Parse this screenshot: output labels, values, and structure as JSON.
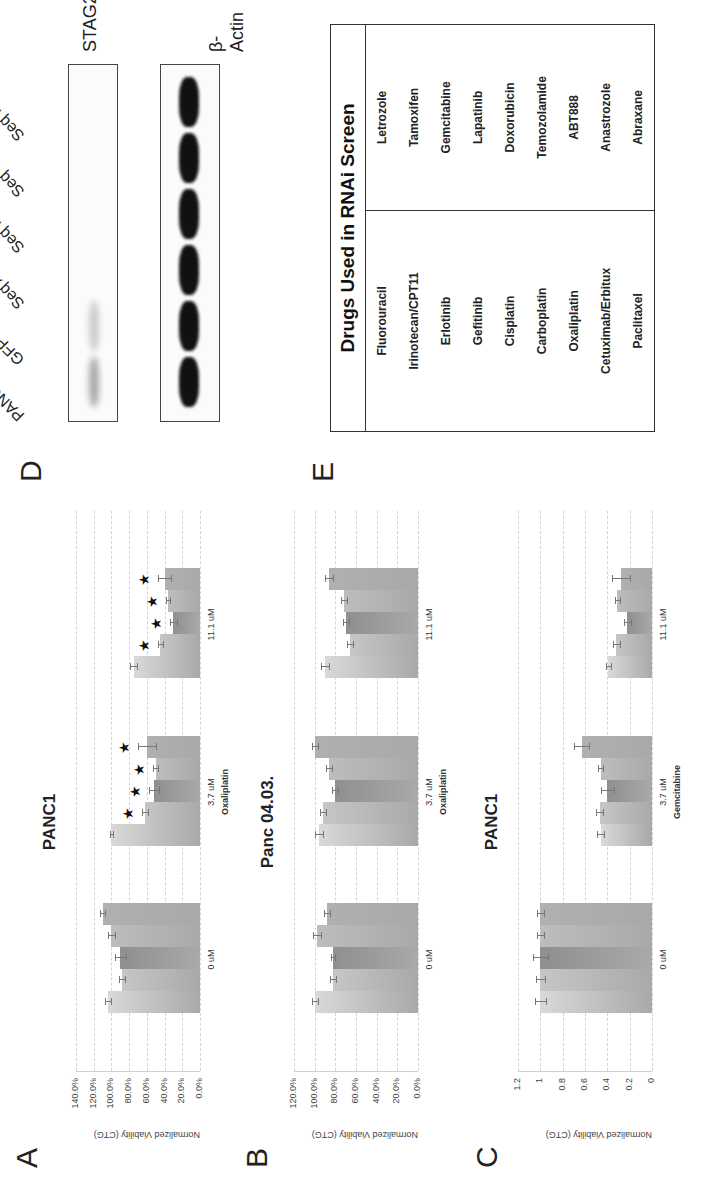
{
  "figure": {
    "panels": {
      "A": {
        "letter": "A"
      },
      "B": {
        "letter": "B"
      },
      "C": {
        "letter": "C"
      },
      "D": {
        "letter": "D"
      },
      "E": {
        "letter": "E"
      }
    }
  },
  "chart_data": [
    {
      "panel": "A",
      "type": "bar",
      "title": "PANC1",
      "xlabel": "Oxaliplatin",
      "ylabel": "Normalized Viability (CTG)",
      "yticks": [
        "0.0%",
        "20.0%",
        "40.0%",
        "60.0%",
        "80.0%",
        "100.0%",
        "120.0%",
        "140.0%"
      ],
      "ylim": [
        0,
        140
      ],
      "grid": true,
      "categories": [
        "0 uM",
        "3.7 uM",
        "11.1 uM"
      ],
      "series": [
        {
          "name": "PANC-1",
          "values": [
            104,
            100,
            75
          ],
          "errors": [
            3,
            2,
            4
          ],
          "significant": [
            false,
            false,
            false
          ]
        },
        {
          "name": "GFP",
          "values": [
            88,
            62,
            45
          ],
          "errors": [
            3,
            3,
            3
          ],
          "significant": [
            false,
            true,
            true
          ]
        },
        {
          "name": "Seq A",
          "values": [
            90,
            52,
            30
          ],
          "errors": [
            6,
            6,
            4
          ],
          "significant": [
            false,
            true,
            true
          ]
        },
        {
          "name": "Seq B",
          "values": [
            100,
            50,
            36
          ],
          "errors": [
            4,
            3,
            2
          ],
          "significant": [
            false,
            true,
            true
          ]
        },
        {
          "name": "Seq C",
          "values": [
            110,
            60,
            40
          ],
          "errors": [
            3,
            10,
            7
          ],
          "significant": [
            false,
            true,
            true
          ]
        }
      ]
    },
    {
      "panel": "B",
      "type": "bar",
      "title": "Panc 04.03.",
      "xlabel": "Oxaliplatin",
      "ylabel": "Normalized Viability (CTG)",
      "yticks": [
        "0.0%",
        "20.0%",
        "40.0%",
        "60.0%",
        "80.0%",
        "100.0%",
        "120.0%"
      ],
      "ylim": [
        0,
        120
      ],
      "grid": true,
      "categories": [
        "0 uM",
        "3.7 uM",
        "11.1 uM"
      ],
      "series": [
        {
          "name": "PANC-1",
          "values": [
            100,
            96,
            90
          ],
          "errors": [
            3,
            4,
            4
          ]
        },
        {
          "name": "GFP",
          "values": [
            82,
            92,
            66
          ],
          "errors": [
            3,
            3,
            3
          ]
        },
        {
          "name": "Seq A",
          "values": [
            82,
            80,
            70
          ],
          "errors": [
            2,
            3,
            3
          ]
        },
        {
          "name": "Seq B",
          "values": [
            98,
            86,
            72
          ],
          "errors": [
            4,
            3,
            3
          ]
        },
        {
          "name": "Seq C",
          "values": [
            88,
            100,
            86
          ],
          "errors": [
            3,
            3,
            4
          ]
        }
      ]
    },
    {
      "panel": "C",
      "type": "bar",
      "title": "PANC1",
      "xlabel": "Gemcitabine",
      "ylabel": "Normalized Viability (CTG)",
      "yticks": [
        "0",
        "0.2",
        "0.4",
        "0.6",
        "0.8",
        "1",
        "1.2"
      ],
      "ylim": [
        0,
        1.2
      ],
      "grid": true,
      "categories": [
        "0 uM",
        "3.7 uM",
        "11.1 uM"
      ],
      "series": [
        {
          "name": "PANC-1",
          "values": [
            1.0,
            0.46,
            0.39
          ],
          "errors": [
            0.05,
            0.03,
            0.02
          ]
        },
        {
          "name": "GFP",
          "values": [
            1.0,
            0.47,
            0.32
          ],
          "errors": [
            0.04,
            0.03,
            0.03
          ]
        },
        {
          "name": "Seq A",
          "values": [
            1.0,
            0.4,
            0.22
          ],
          "errors": [
            0.07,
            0.06,
            0.03
          ]
        },
        {
          "name": "Seq B",
          "values": [
            1.0,
            0.46,
            0.31
          ],
          "errors": [
            0.03,
            0.02,
            0.02
          ]
        },
        {
          "name": "Seq C",
          "values": [
            1.0,
            0.63,
            0.28
          ],
          "errors": [
            0.03,
            0.07,
            0.08
          ]
        }
      ]
    }
  ],
  "blot": {
    "lanes": [
      "PANC-1",
      "GFP",
      "Seq A",
      "Seq B",
      "Seq C",
      "Seq D"
    ],
    "rows": [
      {
        "name": "STAG2",
        "intensity": [
          0.35,
          0.2,
          0.0,
          0.0,
          0.0,
          0.0
        ]
      },
      {
        "name": "β-Actin",
        "intensity": [
          1,
          1,
          1,
          1,
          1,
          1
        ]
      }
    ]
  },
  "drug_table": {
    "title": "Drugs Used in RNAi Screen",
    "left": [
      "Fluorouracil",
      "Irinotecan/CPT11",
      "Erlotinib",
      "Gefitinib",
      "Cisplatin",
      "Carboplatin",
      "Oxaliplatin",
      "Cetuximab/Erbitux",
      "Paclitaxel"
    ],
    "right": [
      "Letrozole",
      "Tamoxifen",
      "Gemcitabine",
      "Lapatinib",
      "Doxorubicin",
      "Temozolamide",
      "ABT888",
      "Anastrozole",
      "Abraxane"
    ]
  },
  "colors": {
    "bar_shades": [
      "#d9d9d9",
      "#c6c6c6",
      "#8f8f8f",
      "#bdbdbd",
      "#b0b0b0"
    ],
    "grid": "#d4d4d4",
    "band": "#111111"
  }
}
